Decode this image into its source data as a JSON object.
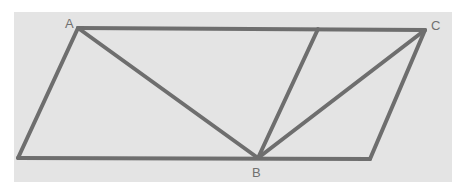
{
  "diagram": {
    "type": "geometry",
    "stroke_color": "#6e6e6e",
    "background_color": "#e4e4e4",
    "labels": [
      {
        "text": "A",
        "x": 65,
        "y": 17
      },
      {
        "text": "B",
        "x": 252,
        "y": 166
      },
      {
        "text": "C",
        "x": 431,
        "y": 19
      }
    ],
    "points": {
      "A": [
        78,
        28
      ],
      "C": [
        425,
        30
      ],
      "B": [
        258,
        158
      ],
      "BL": [
        18,
        158
      ],
      "BR": [
        370,
        159
      ],
      "M": [
        318,
        29
      ]
    },
    "segments": [
      [
        "A",
        "C"
      ],
      [
        "BL",
        "BR"
      ],
      [
        "BL",
        "A"
      ],
      [
        "BR",
        "C"
      ],
      [
        "A",
        "B"
      ],
      [
        "B",
        "M"
      ],
      [
        "B",
        "C"
      ]
    ]
  }
}
